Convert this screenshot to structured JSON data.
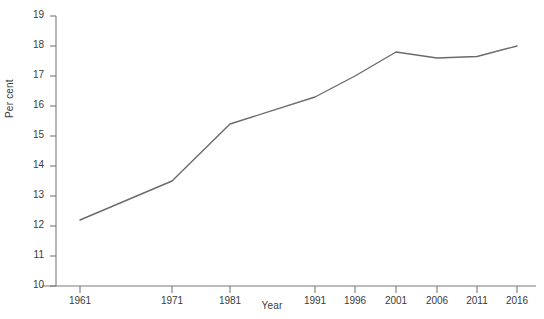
{
  "chart_data": {
    "type": "line",
    "title": "",
    "xlabel": "Year",
    "ylabel": "Per cent",
    "categories": [
      "1961",
      "1971",
      "1981",
      "1991",
      "1996",
      "2001",
      "2006",
      "2011",
      "2016"
    ],
    "x": [
      1961,
      1971,
      1981,
      1991,
      1996,
      2001,
      2006,
      2011,
      2016
    ],
    "values": [
      12.2,
      13.5,
      15.4,
      16.3,
      17.0,
      17.8,
      17.6,
      17.65,
      18.0
    ],
    "ylim": [
      10,
      19
    ],
    "yticks": [
      10,
      11,
      12,
      13,
      14,
      15,
      16,
      17,
      18,
      19
    ],
    "ytick_labels": [
      "10",
      "11",
      "12",
      "13",
      "14",
      "15",
      "16",
      "17",
      "18",
      "19"
    ],
    "xticks": [
      1961,
      1971,
      1981,
      1991,
      1996,
      2001,
      2006,
      2011,
      2016
    ],
    "xtick_labels": [
      "1961",
      "1971",
      "1981",
      "1991",
      "1996",
      "2001",
      "2006",
      "2011",
      "2016"
    ],
    "grid": false,
    "legend": null,
    "legend_position": "none",
    "series": [
      {
        "name": "Per cent",
        "values": [
          12.2,
          13.5,
          15.4,
          16.3,
          17.0,
          17.8,
          17.6,
          17.65,
          18.0
        ]
      }
    ],
    "line_color": "#6b6b6b",
    "axis_color": "#7a7a7a",
    "text_color": "#3a3a3a",
    "background_color": "#ffffff"
  }
}
